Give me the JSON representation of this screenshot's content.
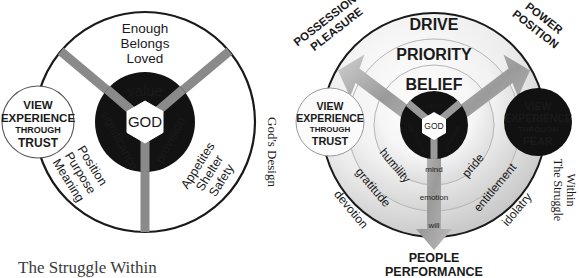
{
  "figure": {
    "caption": "The Struggle Within"
  },
  "left_diagram": {
    "name": "God's Design",
    "side_label": "God's Design",
    "center_label": "GOD",
    "inner_segments": [
      {
        "label": "value",
        "position": "top"
      },
      {
        "label": "significance",
        "position": "lower-left"
      },
      {
        "label": "provision",
        "position": "lower-right"
      }
    ],
    "outer_groups": [
      {
        "position": "top",
        "lines": [
          "Enough",
          "Belongs",
          "Loved"
        ]
      },
      {
        "position": "lower-left",
        "lines": [
          "Position",
          "Purpose",
          "Meaning"
        ]
      },
      {
        "position": "lower-right",
        "lines": [
          "Appetites",
          "Shelter",
          "Safety"
        ]
      }
    ],
    "badge": {
      "lines": [
        "VIEW",
        "EXPERIENCE",
        "THROUGH",
        "TRUST"
      ],
      "style": "light"
    }
  },
  "right_diagram": {
    "name": "The Struggle Within",
    "side_label_lines": [
      "The Struggle",
      "Within"
    ],
    "center_label": "GOD",
    "inner_segments": [
      {
        "label": "value",
        "position": "top"
      },
      {
        "label": "significance",
        "position": "lower-left"
      },
      {
        "label": "provision",
        "position": "lower-right"
      }
    ],
    "ring_labels_top": [
      "BELIEF",
      "PRIORITY",
      "DRIVE"
    ],
    "ring_labels_left": [
      "humility",
      "gratitude",
      "devotion"
    ],
    "ring_labels_right": [
      "pride",
      "entitlement",
      "idolatry"
    ],
    "axis_labels_bottom": [
      "mind",
      "emotion",
      "will"
    ],
    "arrows": [
      {
        "direction": "upper-left",
        "lines": [
          "POSSESSIONS",
          "PLEASURE"
        ]
      },
      {
        "direction": "upper-right",
        "lines": [
          "POWER",
          "POSITION"
        ]
      },
      {
        "direction": "down",
        "lines": [
          "PEOPLE",
          "PERFORMANCE"
        ]
      }
    ],
    "badge_left": {
      "lines": [
        "VIEW",
        "EXPERIENCE",
        "THROUGH",
        "TRUST"
      ],
      "style": "light"
    },
    "badge_right": {
      "lines": [
        "VIEW",
        "EXPERIENCE",
        "THROUGH",
        "FEAR"
      ],
      "style": "dark"
    }
  },
  "colors": {
    "ink": "#1a1a1a",
    "core_dark": "#121212",
    "spoke_gray": "#8a8a8a",
    "ring_light": "#f2f2f2",
    "ring_mid": "#d8d8d8",
    "arrow_gray": "#a6a6a6",
    "badge_dark": "#111111",
    "badge_light": "#ffffff"
  }
}
